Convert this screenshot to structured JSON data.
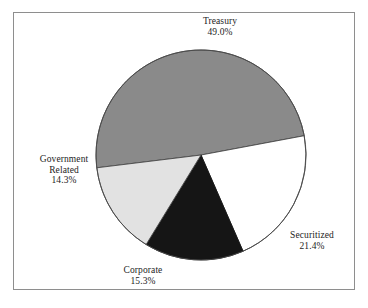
{
  "figure": {
    "background_color": "#ffffff",
    "frame_color": "#8e8e8e"
  },
  "chart_data": {
    "type": "pie",
    "title": "",
    "subtitle": "",
    "xlabel": "",
    "ylabel": "",
    "legend_position": "none",
    "grid": false,
    "labels_placement": "outside",
    "total_percent": "100.0%",
    "start_angle_deg": 173,
    "direction": "clockwise",
    "categories": [
      "Treasury",
      "Securitized",
      "Corporate",
      "Government Related"
    ],
    "values": [
      49.0,
      21.4,
      15.3,
      14.3
    ],
    "slices": [
      {
        "name": "Treasury",
        "label": "Treasury",
        "value": 49.0,
        "value_text": "49.0%",
        "color": "#8a8a8a",
        "edge_color": "#4a4a4a",
        "start_angle_deg": 173.0,
        "sweep_deg": 176.4
      },
      {
        "name": "Securitized",
        "label": "Securitized",
        "value": 21.4,
        "value_text": "21.4%",
        "color": "#ffffff",
        "edge_color": "#4a4a4a",
        "start_angle_deg": 349.4,
        "sweep_deg": 77.0
      },
      {
        "name": "Corporate",
        "label": "Corporate",
        "value": 15.3,
        "value_text": "15.3%",
        "color": "#151515",
        "edge_color": "#151515",
        "start_angle_deg": 66.4,
        "sweep_deg": 55.1
      },
      {
        "name": "Government Related",
        "label_line1": "Government",
        "label_line2": "Related",
        "label": "Government Related",
        "value": 14.3,
        "value_text": "14.3%",
        "color": "#e2e2e2",
        "edge_color": "#4a4a4a",
        "start_angle_deg": 121.5,
        "sweep_deg": 51.5
      }
    ]
  }
}
